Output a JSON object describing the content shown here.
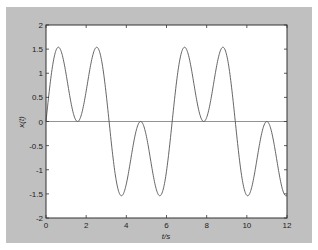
{
  "chart_data": {
    "type": "line",
    "title": "",
    "xlabel": "t/s",
    "ylabel": "x(t)",
    "xlim": [
      0,
      12
    ],
    "ylim": [
      -2,
      2
    ],
    "x_ticks": [
      0,
      2,
      4,
      6,
      8,
      10,
      12
    ],
    "y_ticks": [
      -2,
      -1.5,
      -1,
      -0.5,
      0,
      0.5,
      1,
      1.5,
      2
    ],
    "x_tick_labels": [
      "0",
      "2",
      "4",
      "6",
      "8",
      "10",
      "12"
    ],
    "y_tick_labels": [
      "-2",
      "-1.5",
      "-1",
      "-0.5",
      "0",
      "0.5",
      "1",
      "1.5",
      "2"
    ],
    "grid": false,
    "legend": null,
    "zero_line": true,
    "series": [
      {
        "name": "x(t) = sin(t) + sin(3t)",
        "color": "#555555",
        "function": "sin(t)+sin(3t)",
        "x": [
          0,
          0.6,
          1.57,
          2.54,
          3.14,
          3.74,
          4.71,
          5.68,
          6.28,
          6.88,
          7.85,
          8.82,
          9.42,
          10.02,
          10.99,
          11.96,
          12
        ],
        "y": [
          0,
          1.54,
          0,
          1.54,
          0,
          -1.54,
          0,
          -1.54,
          0,
          1.54,
          0,
          1.54,
          0,
          -1.54,
          0,
          -1.54,
          -1.52
        ]
      }
    ],
    "colors": {
      "figure_background": "#c0c0c0",
      "axes_background": "#ffffff",
      "axes_border": "#333333",
      "line": "#555555",
      "zero_line": "#777777"
    }
  }
}
